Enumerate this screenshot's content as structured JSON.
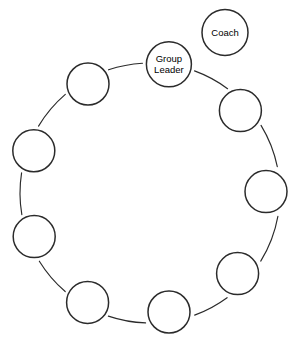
{
  "diagram": {
    "background_color": "#ffffff",
    "stroke_color": "#2b2b2b",
    "geometry": {
      "width": 301,
      "height": 354,
      "ring_center_x": 150,
      "ring_center_y": 193,
      "ring_radius": 130,
      "node_radius": 21,
      "angle_step_degrees": 40,
      "start_angle_degrees": -98
    },
    "ring_nodes": [
      {
        "id": "group-leader",
        "label_lines": [
          "Group",
          "Leader"
        ],
        "labeled": true,
        "cx": 168.9,
        "cy": 64.3,
        "r": 22.5
      },
      {
        "id": "member-1",
        "label_lines": [],
        "labeled": false,
        "cx": 240.4,
        "cy": 110.6,
        "r": 21
      },
      {
        "id": "member-2",
        "label_lines": [],
        "labeled": false,
        "cx": 266.0,
        "cy": 191.6,
        "r": 21
      },
      {
        "id": "member-3",
        "label_lines": [],
        "labeled": false,
        "cx": 237.6,
        "cy": 273.6,
        "r": 21
      },
      {
        "id": "member-4",
        "label_lines": [],
        "labeled": false,
        "cx": 169.0,
        "cy": 312.0,
        "r": 21
      },
      {
        "id": "member-5",
        "label_lines": [],
        "labeled": false,
        "cx": 87.6,
        "cy": 302.4,
        "r": 21
      },
      {
        "id": "member-6",
        "label_lines": [],
        "labeled": false,
        "cx": 34.2,
        "cy": 236.6,
        "r": 21
      },
      {
        "id": "member-7",
        "label_lines": [],
        "labeled": false,
        "cx": 33.8,
        "cy": 150.8,
        "r": 21
      },
      {
        "id": "member-8",
        "label_lines": [],
        "labeled": false,
        "cx": 88.0,
        "cy": 84.0,
        "r": 21
      }
    ],
    "outside_nodes": [
      {
        "id": "coach",
        "label_lines": [
          "Coach"
        ],
        "labeled": true,
        "cx": 225.0,
        "cy": 32.5,
        "r": 23,
        "connected_to_ring": false
      }
    ],
    "connectors": {
      "style": "curved-arc",
      "count": 9,
      "note": "Thin arcs link adjacent ring nodes; the Coach node is detached from the ring."
    }
  }
}
